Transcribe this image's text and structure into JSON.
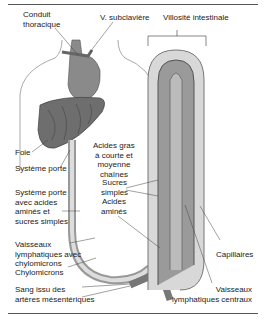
{
  "figure": {
    "labels": {
      "conduit_thoracique": "Conduit\nthoracique",
      "v_subclaviere": "V. subclavière",
      "villosite_intestinale": "Villosité intestinale",
      "foie": "Foie",
      "systeme_porte": "Système porte",
      "systeme_porte_avec": "Système porte\navec acides\naminés et\nsucres simples",
      "acides_gras": "Acides gras\nà courte et\nmoyenne\nchaînes",
      "sucres_simples": "Sucres\nsimples",
      "acides_amines": "Acides\naminés",
      "vaisseaux_lymph_chylo": "Vaisseaux\nlymphatiques avec\nchylomicrons",
      "chylomicrons": "Chylomicrons",
      "sang_issu": "Sang issu des\nartères mésentériques",
      "capillaires": "Capillaires",
      "vaisseaux_lymph_centraux": "Vaisseaux\nlymphatiques centraux"
    },
    "colors": {
      "organ_fill": "#7a7a7a",
      "tissue_fill": "#c8c8c8",
      "body_outline": "#aaaaaa",
      "rule": "#555555"
    }
  }
}
